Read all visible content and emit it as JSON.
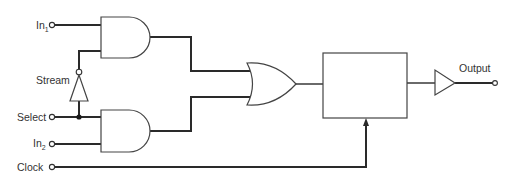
{
  "diagram": {
    "title": "",
    "inputs": [
      {
        "id": "in1",
        "label": "In",
        "subscript": "1"
      },
      {
        "id": "stream",
        "label": "Stream"
      },
      {
        "id": "select",
        "label": "Select"
      },
      {
        "id": "in2",
        "label": "In",
        "subscript": "2"
      },
      {
        "id": "clock",
        "label": "Clock"
      }
    ],
    "outputs": [
      {
        "id": "output",
        "label": "Output"
      }
    ],
    "components": [
      {
        "id": "and-gate-top",
        "type": "AND",
        "inputs": [
          "In1",
          "NOT(Select)"
        ]
      },
      {
        "id": "inverter",
        "type": "NOT",
        "input": "Select"
      },
      {
        "id": "and-gate-bottom",
        "type": "AND",
        "inputs": [
          "Select",
          "In2"
        ]
      },
      {
        "id": "or-gate",
        "type": "OR",
        "inputs": [
          "and-gate-top",
          "and-gate-bottom"
        ]
      },
      {
        "id": "clocked-block",
        "type": "block",
        "inputs": [
          "or-gate"
        ],
        "clock": "Clock"
      },
      {
        "id": "output-buffer",
        "type": "BUFFER",
        "input": "clocked-block"
      }
    ],
    "colors": {
      "line": "#2a2a2a",
      "background": "#ffffff",
      "text": "#333333"
    }
  }
}
